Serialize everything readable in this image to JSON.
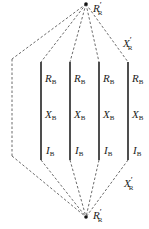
{
  "diagram": {
    "top_node": {
      "label": "R",
      "prime": "′",
      "sub": "R"
    },
    "bottom_node": {
      "label": "R",
      "prime": "′",
      "sub": "R"
    },
    "top_right_label": {
      "label": "X",
      "prime": "′",
      "sub": "R"
    },
    "bottom_right_label": {
      "label": "X",
      "prime": "′",
      "sub": "R"
    },
    "branches": [
      {
        "r": "R",
        "x": "X",
        "i": "I",
        "sub": "B"
      },
      {
        "r": "R",
        "x": "X",
        "i": "I",
        "sub": "B"
      },
      {
        "r": "R",
        "x": "X",
        "i": "I",
        "sub": "B"
      },
      {
        "r": "R",
        "x": "X",
        "i": "I",
        "sub": "B"
      }
    ],
    "colors": {
      "line": "#333333",
      "text": "#222222"
    }
  }
}
